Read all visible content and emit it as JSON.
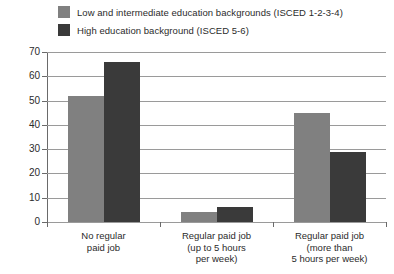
{
  "chart_data": {
    "type": "bar",
    "title": "",
    "subtitle": "",
    "xlabel": "",
    "ylabel": "",
    "ylim": [
      0,
      70
    ],
    "ytick_step": 10,
    "ytick_labels": [
      "70",
      "60",
      "50",
      "40",
      "30",
      "20",
      "10",
      "0"
    ],
    "grid": "horizontal",
    "legend_position": "top-left",
    "categories": [
      "No regular\npaid job",
      "Regular paid job\n(up to 5 hours\nper week)",
      "Regular paid job\n(more than\n5 hours per week)"
    ],
    "category_lines": [
      [
        "No regular",
        "paid job"
      ],
      [
        "Regular paid job",
        "(up to 5 hours",
        "per week)"
      ],
      [
        "Regular paid job",
        "(more than",
        "5 hours per week)"
      ]
    ],
    "series": [
      {
        "name": "Low and intermediate education backgrounds (ISCED 1-2-3-4)",
        "color": "#808080",
        "values": [
          52,
          4,
          45
        ]
      },
      {
        "name": "High education background (ISCED 5-6)",
        "color": "#3a3a3a",
        "values": [
          66,
          6,
          29
        ]
      }
    ]
  },
  "legend": {
    "items": [
      {
        "label": "Low and intermediate education backgrounds (ISCED 1-2-3-4)",
        "color": "#808080",
        "swatch_name": "legend-swatch-low-intermediate"
      },
      {
        "label": "High education background (ISCED 5-6)",
        "color": "#3a3a3a",
        "swatch_name": "legend-swatch-high"
      }
    ]
  },
  "axes": {
    "y_tick_values": [
      70,
      60,
      50,
      40,
      30,
      20,
      10,
      0
    ],
    "y_max": 70,
    "y_min": 0
  }
}
